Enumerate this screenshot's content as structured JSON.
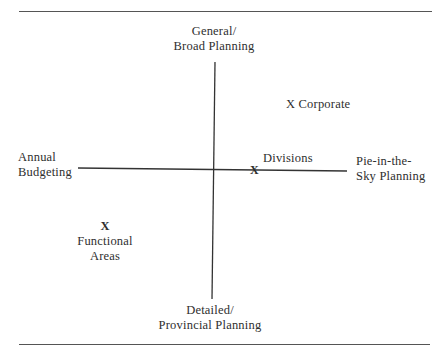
{
  "diagram": {
    "type": "quadrant-grid",
    "vertical_axis": {
      "top_label": [
        "General/",
        "Broad Planning"
      ],
      "bottom_label": [
        "Detailed/",
        "Provincial Planning"
      ]
    },
    "horizontal_axis": {
      "left_label": [
        "Annual",
        "Budgeting"
      ],
      "right_label": [
        "Pie-in-the-",
        "Sky Planning"
      ]
    },
    "marker_glyph": "X",
    "points": [
      {
        "name": "Corporate",
        "label": "X Corporate",
        "quadrant": "upper-right"
      },
      {
        "name": "Divisions",
        "label": "Divisions",
        "quadrant": "on horizontal axis, right of center"
      },
      {
        "name": "Functional Areas",
        "label": [
          "Functional",
          "Areas"
        ],
        "quadrant": "lower-left"
      }
    ],
    "colors": {
      "lines": "#333333",
      "rules": "#555555",
      "text": "#2e2e2e",
      "background": "#ffffff"
    }
  }
}
